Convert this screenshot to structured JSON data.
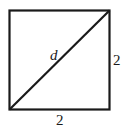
{
  "diagram": {
    "type": "square-with-diagonal",
    "labels": {
      "diagonal": "d",
      "right_side": "2",
      "bottom_side": "2"
    },
    "colors": {
      "stroke": "#1a1a1a",
      "background": "#ffffff"
    }
  }
}
